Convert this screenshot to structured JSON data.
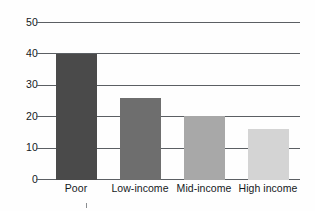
{
  "chart_data": {
    "type": "bar",
    "title": "",
    "subtitle": "",
    "xlabel": "",
    "ylabel": "",
    "categories": [
      "Poor",
      "Low-income",
      "Mid-income",
      "High income"
    ],
    "values": [
      40,
      26,
      20.3,
      16.3
    ],
    "series": [
      {
        "name": "",
        "values": [
          40,
          26,
          20.3,
          16.3
        ]
      }
    ],
    "ylim": [
      0,
      50
    ],
    "ytick_labels": [
      "0",
      "10",
      "20",
      "30",
      "40",
      "50"
    ],
    "ytick_values": [
      0,
      10,
      20,
      30,
      40,
      50
    ],
    "grid": "horizontal",
    "legend": "none",
    "annotations": [],
    "bar_colors": [
      "#4a4a4a",
      "#6e6e6e",
      "#a8a8a8",
      "#d4d4d4"
    ],
    "colors": {
      "background": "#fefefe",
      "gridline": "#5b5f63",
      "axis_text": "#15191c"
    }
  }
}
